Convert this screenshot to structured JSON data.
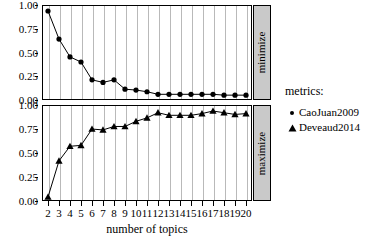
{
  "chart_data": {
    "type": "line",
    "title": "",
    "xlabel": "number of topics",
    "ylabel": "",
    "xlim": [
      2,
      20
    ],
    "ylim": [
      0,
      1
    ],
    "grid": "vertical",
    "legend_position": "right",
    "legend_title": "metrics:",
    "x": [
      2,
      3,
      4,
      5,
      6,
      7,
      8,
      9,
      10,
      11,
      12,
      13,
      14,
      15,
      16,
      17,
      18,
      19,
      20
    ],
    "xticks": [
      "2",
      "3",
      "4",
      "5",
      "6",
      "7",
      "8",
      "9",
      "10",
      "11",
      "12",
      "13",
      "14",
      "15",
      "16",
      "17",
      "18",
      "19",
      "20"
    ],
    "yticks": [
      "0.00",
      "0.25",
      "0.50",
      "0.75",
      "1.00"
    ],
    "ytick_values": [
      0,
      0.25,
      0.5,
      0.75,
      1
    ],
    "panels": [
      {
        "strip_label": "minimize",
        "series": [
          {
            "name": "CaoJuan2009",
            "marker": "circle",
            "values": [
              1.0,
              0.67,
              0.46,
              0.4,
              0.19,
              0.16,
              0.19,
              0.08,
              0.07,
              0.05,
              0.02,
              0.02,
              0.02,
              0.02,
              0.02,
              0.02,
              0.01,
              0.01,
              0.01
            ]
          }
        ]
      },
      {
        "strip_label": "maximize",
        "series": [
          {
            "name": "Deveaud2014",
            "marker": "triangle",
            "values": [
              0.0,
              0.42,
              0.59,
              0.6,
              0.79,
              0.78,
              0.82,
              0.82,
              0.88,
              0.92,
              0.98,
              0.95,
              0.95,
              0.95,
              0.97,
              1.0,
              0.98,
              0.96,
              0.97
            ]
          }
        ]
      }
    ],
    "series_colors": {
      "CaoJuan2009": "#000000",
      "Deveaud2014": "#000000"
    },
    "legend_entries": [
      {
        "label": "CaoJuan2009",
        "marker": "circle"
      },
      {
        "label": "Deveaud2014",
        "marker": "triangle"
      }
    ]
  }
}
